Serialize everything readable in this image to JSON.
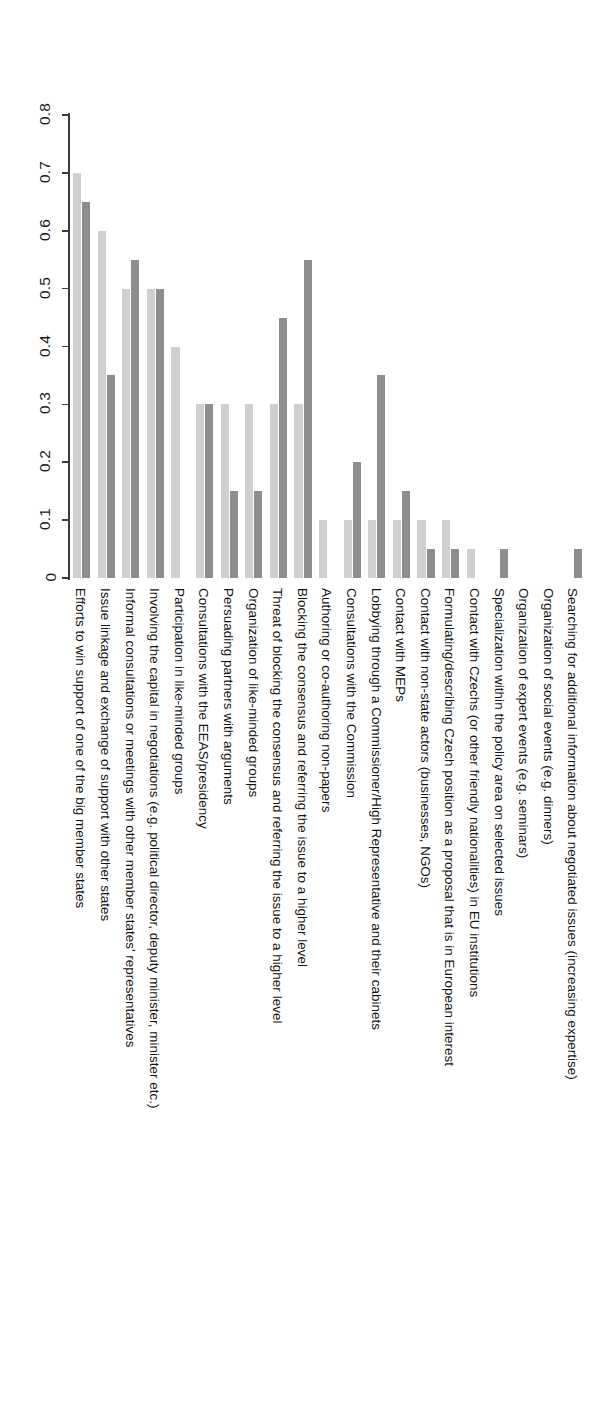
{
  "chart_data": {
    "type": "bar",
    "title": "",
    "subtitle": "",
    "xlabel": "",
    "ylabel": "",
    "ylim": [
      0,
      0.8
    ],
    "grid": false,
    "orientation": "vertical-rotated-90",
    "legend": [],
    "ticks": [
      "0",
      "0.1",
      "0.2",
      "0.3",
      "0.4",
      "0.5",
      "0.6",
      "0.7",
      "0.8"
    ],
    "tick_values": [
      0,
      0.1,
      0.2,
      0.3,
      0.4,
      0.5,
      0.6,
      0.7,
      0.8
    ],
    "categories": [
      "Efforts to win support of one of the big member states",
      "Issue linkage and exchange of support with other states",
      "Informal consultations or meetings with other member states' representatives",
      "Involving the capital in negotiations (e.g. political director, deputy minister, minister etc.)",
      "Participation in like-minded groups",
      "Consultations with the EEAS/presidency",
      "Persuading partners with arguments",
      "Organization of like-minded groups",
      "Threat of blocking the consensus and referring the issue to a higher level",
      "Blocking the consensus and referring the issue to a higher level",
      "Authoring or co-authoring non-papers",
      "Consultations with the Commission",
      "Lobbying through a Commissioner/High Representative and their cabinets",
      "Contact with MEPs",
      "Contact with non-state actors (businesses, NGOs)",
      "Formulating/describing Czech position as a proposal that is in European interest",
      "Contact with Czechs (or other friendly nationalities) in EU institutions",
      "Specialization within the policy area on selected issues",
      "Organization of expert events (e.g. seminars)",
      "Organization of social events (e.g. dinners)",
      "Searching for additional information about negotiated issues (increasing expertise)"
    ],
    "series": [
      {
        "name": "series-light",
        "color": "#cfcfcf",
        "values": [
          0.7,
          0.6,
          0.5,
          0.5,
          0.4,
          0.3,
          0.3,
          0.3,
          0.3,
          0.3,
          0.1,
          0.1,
          0.1,
          0.1,
          0.1,
          0.1,
          0.05,
          0.0,
          0.0,
          0.0,
          0.0
        ]
      },
      {
        "name": "series-dark",
        "color": "#8d8d8d",
        "values": [
          0.65,
          0.35,
          0.55,
          0.5,
          0.0,
          0.3,
          0.15,
          0.15,
          0.45,
          0.55,
          0.0,
          0.2,
          0.35,
          0.15,
          0.05,
          0.05,
          0.0,
          0.05,
          0.0,
          0.0,
          0.05
        ]
      }
    ]
  }
}
